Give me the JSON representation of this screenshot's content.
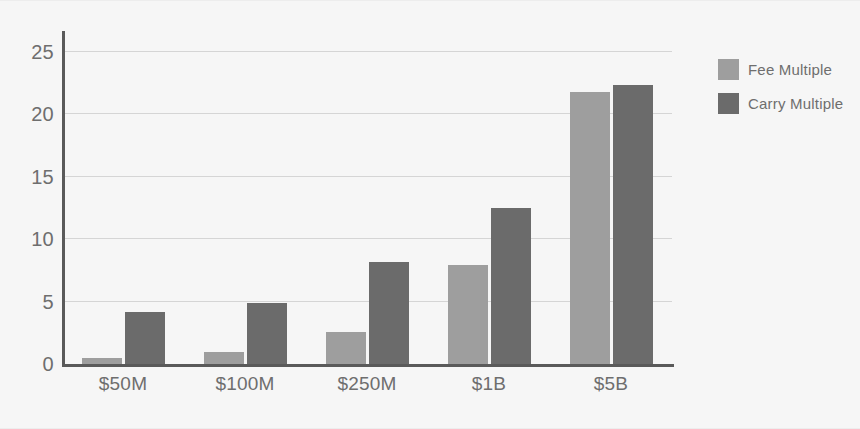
{
  "chart_data": {
    "type": "bar",
    "title": "",
    "subtitle": "",
    "xlabel": "",
    "ylabel": "",
    "categories": [
      "$50M",
      "$100M",
      "$250M",
      "$1B",
      "$5B"
    ],
    "series": [
      {
        "name": "Fee Multiple",
        "color": "#9e9e9e",
        "values": [
          0.5,
          1.0,
          2.6,
          7.9,
          21.8
        ]
      },
      {
        "name": "Carry Multiple",
        "color": "#6b6b6b",
        "values": [
          4.2,
          4.9,
          8.2,
          12.5,
          22.3
        ]
      }
    ],
    "ylim": [
      0,
      26
    ],
    "yticks": [
      0,
      5,
      10,
      15,
      20,
      25
    ],
    "ytick_labels": [
      "0",
      "5",
      "10",
      "15",
      "20",
      "25"
    ],
    "grid": true,
    "grid_axis": "y",
    "legend_position": "right",
    "background_color": "#f6f6f6",
    "axis_color": "#5a5a5a",
    "gridline_color": "#d5d5d5",
    "tick_label_color": "#6e6e6e"
  },
  "legend": {
    "items": [
      {
        "label": "Fee Multiple",
        "color": "#9e9e9e"
      },
      {
        "label": "Carry Multiple",
        "color": "#6b6b6b"
      }
    ]
  }
}
